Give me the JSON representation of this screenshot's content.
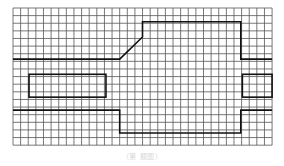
{
  "diagram": {
    "type": "grid-outline-figure",
    "grid": {
      "origin": [
        13,
        8
      ],
      "columns": 34,
      "rows": 18,
      "cell_size": 7.62,
      "line_color": "#555555",
      "line_width": 0.8
    },
    "outline": {
      "color": "#111111",
      "stroke_width": 1.6,
      "top_path": [
        [
          0,
          6.7
        ],
        [
          14,
          6.7
        ],
        [
          17,
          3.8
        ],
        [
          17,
          1.8
        ],
        [
          29.9,
          1.8
        ],
        [
          29.9,
          6.7
        ],
        [
          34,
          6.7
        ]
      ],
      "bottom_path": [
        [
          0,
          13.4
        ],
        [
          14,
          13.4
        ],
        [
          14,
          16.4
        ],
        [
          29.9,
          16.4
        ],
        [
          29.9,
          13.4
        ],
        [
          34,
          13.4
        ]
      ],
      "left_rect": {
        "x": 2.1,
        "y": 8.7,
        "w": 10.1,
        "h": 3.0
      },
      "right_rect": {
        "x": 30.1,
        "y": 8.7,
        "w": 3.9,
        "h": 3.0
      }
    }
  },
  "caption": "（第 题图）"
}
